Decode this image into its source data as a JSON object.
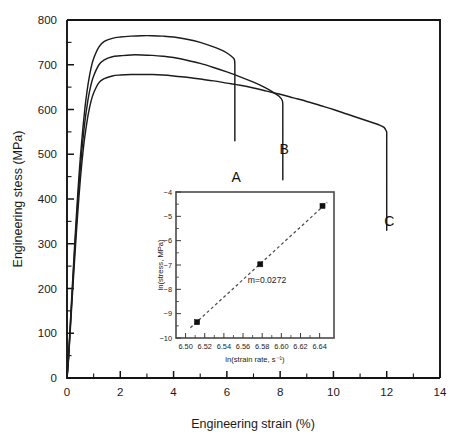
{
  "chart_data": [
    {
      "id": "main",
      "type": "line",
      "title": "",
      "xlabel": "Engineering strain (%)",
      "ylabel": "Engineering stess (MPa)",
      "xlim": [
        0,
        14
      ],
      "ylim": [
        0,
        800
      ],
      "xticks": [
        0,
        2,
        4,
        6,
        8,
        10,
        12,
        14
      ],
      "xticklabels": [
        "0",
        "2",
        "4",
        "6",
        "8",
        "10",
        "12",
        "14"
      ],
      "yticks": [
        0,
        100,
        200,
        300,
        400,
        500,
        600,
        700,
        800
      ],
      "yticklabels": [
        "0",
        "100",
        "200",
        "300",
        "400",
        "500",
        "600",
        "700",
        "800"
      ],
      "x_minor_step": 1,
      "y_minor_step": 50,
      "grid": false,
      "legend": "none",
      "annotations": [
        {
          "text": "A",
          "x": 6.35,
          "y": 437
        },
        {
          "text": "B",
          "x": 8.15,
          "y": 500
        },
        {
          "text": "C",
          "x": 12.1,
          "y": 340
        }
      ],
      "series": [
        {
          "name": "A",
          "label": "A",
          "peak_stress": 765,
          "fracture_strain": 6.3,
          "points": [
            [
              0.0,
              0
            ],
            [
              0.05,
              40
            ],
            [
              0.1,
              95
            ],
            [
              0.15,
              150
            ],
            [
              0.2,
              205
            ],
            [
              0.25,
              258
            ],
            [
              0.3,
              310
            ],
            [
              0.35,
              360
            ],
            [
              0.4,
              408
            ],
            [
              0.45,
              452
            ],
            [
              0.5,
              492
            ],
            [
              0.55,
              527
            ],
            [
              0.6,
              560
            ],
            [
              0.65,
              590
            ],
            [
              0.7,
              617
            ],
            [
              0.8,
              660
            ],
            [
              0.9,
              692
            ],
            [
              1.0,
              714
            ],
            [
              1.2,
              740
            ],
            [
              1.4,
              752
            ],
            [
              1.7,
              759
            ],
            [
              2.0,
              762
            ],
            [
              2.4,
              764
            ],
            [
              2.8,
              765
            ],
            [
              3.2,
              765
            ],
            [
              3.6,
              764
            ],
            [
              4.0,
              762
            ],
            [
              4.5,
              757
            ],
            [
              5.0,
              750
            ],
            [
              5.5,
              740
            ],
            [
              5.9,
              730
            ],
            [
              6.15,
              720
            ],
            [
              6.28,
              712
            ],
            [
              6.3,
              700
            ],
            [
              6.3,
              530
            ]
          ]
        },
        {
          "name": "B",
          "label": "B",
          "peak_stress": 722,
          "fracture_strain": 8.1,
          "points": [
            [
              0.0,
              0
            ],
            [
              0.05,
              38
            ],
            [
              0.1,
              90
            ],
            [
              0.15,
              143
            ],
            [
              0.2,
              195
            ],
            [
              0.25,
              246
            ],
            [
              0.3,
              296
            ],
            [
              0.35,
              344
            ],
            [
              0.4,
              390
            ],
            [
              0.45,
              432
            ],
            [
              0.5,
              470
            ],
            [
              0.55,
              504
            ],
            [
              0.6,
              534
            ],
            [
              0.65,
              562
            ],
            [
              0.7,
              586
            ],
            [
              0.8,
              626
            ],
            [
              0.9,
              655
            ],
            [
              1.0,
              675
            ],
            [
              1.2,
              700
            ],
            [
              1.4,
              711
            ],
            [
              1.7,
              718
            ],
            [
              2.0,
              720
            ],
            [
              2.4,
              722
            ],
            [
              2.8,
              722
            ],
            [
              3.2,
              721
            ],
            [
              3.6,
              719
            ],
            [
              4.0,
              716
            ],
            [
              4.5,
              710
            ],
            [
              5.0,
              703
            ],
            [
              5.5,
              694
            ],
            [
              6.0,
              684
            ],
            [
              6.5,
              673
            ],
            [
              7.0,
              661
            ],
            [
              7.4,
              650
            ],
            [
              7.7,
              640
            ],
            [
              7.95,
              630
            ],
            [
              8.08,
              620
            ],
            [
              8.1,
              610
            ],
            [
              8.1,
              443
            ]
          ]
        },
        {
          "name": "C",
          "label": "C",
          "peak_stress": 678,
          "fracture_strain": 12.0,
          "points": [
            [
              0.0,
              0
            ],
            [
              0.05,
              35
            ],
            [
              0.1,
              84
            ],
            [
              0.15,
              134
            ],
            [
              0.2,
              183
            ],
            [
              0.25,
              231
            ],
            [
              0.3,
              278
            ],
            [
              0.35,
              323
            ],
            [
              0.4,
              366
            ],
            [
              0.45,
              406
            ],
            [
              0.5,
              443
            ],
            [
              0.55,
              476
            ],
            [
              0.6,
              505
            ],
            [
              0.65,
              531
            ],
            [
              0.7,
              553
            ],
            [
              0.8,
              590
            ],
            [
              0.9,
              618
            ],
            [
              1.0,
              637
            ],
            [
              1.2,
              660
            ],
            [
              1.4,
              669
            ],
            [
              1.7,
              675
            ],
            [
              2.0,
              677
            ],
            [
              2.4,
              678
            ],
            [
              2.8,
              678
            ],
            [
              3.2,
              678
            ],
            [
              3.6,
              677
            ],
            [
              4.0,
              675
            ],
            [
              4.5,
              672
            ],
            [
              5.0,
              668
            ],
            [
              5.5,
              664
            ],
            [
              6.0,
              659
            ],
            [
              6.5,
              654
            ],
            [
              7.0,
              648
            ],
            [
              7.5,
              641
            ],
            [
              8.0,
              634
            ],
            [
              8.5,
              626
            ],
            [
              9.0,
              618
            ],
            [
              9.5,
              609
            ],
            [
              10.0,
              600
            ],
            [
              10.5,
              590
            ],
            [
              11.0,
              580
            ],
            [
              11.4,
              572
            ],
            [
              11.7,
              566
            ],
            [
              11.9,
              560
            ],
            [
              12.0,
              550
            ],
            [
              12.0,
              330
            ]
          ]
        }
      ]
    },
    {
      "id": "inset",
      "type": "scatter",
      "title": "",
      "xlabel": "ln(strain rate, s⁻¹)",
      "ylabel": "ln(stress, MPa)",
      "xlim": [
        6.49,
        6.655
      ],
      "ylim": [
        -10,
        -4
      ],
      "xticks": [
        6.5,
        6.52,
        6.54,
        6.56,
        6.58,
        6.6,
        6.62,
        6.64
      ],
      "xticklabels": [
        "6.50",
        "6.52",
        "6.54",
        "6.56",
        "6.58",
        "6.60",
        "6.62",
        "6.64"
      ],
      "yticks": [
        -10,
        -9,
        -8,
        -7,
        -6,
        -5,
        -4
      ],
      "yticklabels": [
        "−10",
        "−9",
        "−8",
        "−7",
        "−6",
        "−5",
        "−4"
      ],
      "grid": false,
      "legend": "none",
      "x": [
        6.512,
        6.578,
        6.643
      ],
      "y": [
        -9.35,
        -6.97,
        -4.57
      ],
      "fit_line": {
        "x": [
          6.505,
          6.648
        ],
        "y": [
          -9.58,
          -4.43
        ],
        "style": "dashed"
      },
      "annotations": [
        {
          "text": "m=0.0272",
          "x": 6.585,
          "y": -7.75
        }
      ]
    }
  ],
  "main_axis": {
    "ylabel": "Engineering stess (MPa)",
    "xlabel": "Engineering strain (%)"
  },
  "inset_axis": {
    "ylabel": "ln(stress, MPa)",
    "xlabel": "ln(strain rate, s⁻¹)",
    "slope_annotation": "m=0.0272"
  },
  "curve_labels": {
    "a": "A",
    "b": "B",
    "c": "C"
  },
  "colors": {
    "curve": "#1c1c1c",
    "axis": "#141414",
    "inset_frame": "#4a4a4a",
    "inset_fit": "#4d4d4d",
    "background": "#ffffff"
  }
}
